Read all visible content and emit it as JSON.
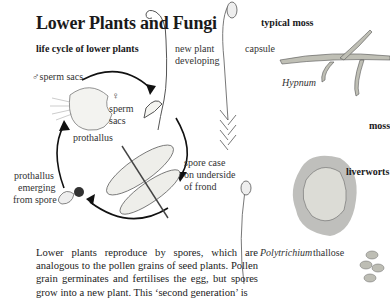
{
  "page": {
    "title": "Lower Plants and Fungi",
    "subheads": {
      "life_cycle": "life cycle of lower plants",
      "typical_moss": "typical moss",
      "moss": "moss",
      "liverworts": "liverworts"
    },
    "labels": {
      "male_sperm_sacs": "♂sperm sacs",
      "female_symbol": "♀",
      "sperm": "sperm",
      "sacs": "sacs",
      "prothallus": "prothallus",
      "new_plant_1": "new plant",
      "new_plant_2": "developing",
      "spore_case_1": "spore case",
      "spore_case_2": "on underside",
      "spore_case_3": "of frond",
      "emerging_1": "prothallus",
      "emerging_2": "emerging",
      "emerging_3": "from spore",
      "capsule": "capsule",
      "hypnum": "Hypnum",
      "polytrichium": "Polytrichium",
      "thallose": "thallose"
    },
    "body_text": "Lower plants reproduce by spores, which are analogous to the pollen grains of seed plants. Pollen grain germinates and fertilises the egg, but spores grow into a new plant. This ‘second generation’ is"
  }
}
